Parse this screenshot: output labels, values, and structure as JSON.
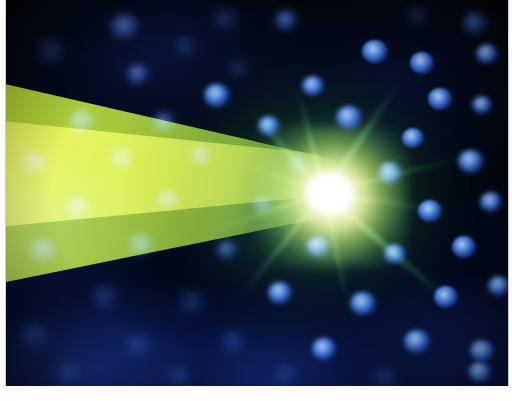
{
  "image": {
    "kind": "fluorescence-micrograph",
    "subject": "neuron with radiating neurites and DAPI-stained nuclei",
    "frame": {
      "border_color": "#ffffff",
      "border_left_px": 6,
      "border_right_px": 4,
      "border_bottom_px": 15,
      "content_width_px": 502,
      "content_height_px": 386
    },
    "background": {
      "base_color": "#000409",
      "haze_color": "#1c3696",
      "description": "dark field with deep blue out-of-focus haze"
    },
    "channels": [
      {
        "name": "green-channel",
        "label": "GFP / green fluorescence",
        "color": "#7ed321",
        "structure": "cell body and neurites"
      },
      {
        "name": "blue-channel",
        "label": "DAPI nuclear stain",
        "color": "#2d5ce0",
        "structure": "nuclei"
      },
      {
        "name": "saturated-core",
        "label": "saturated soma",
        "color": "#ffffff",
        "structure": "bright cell body"
      }
    ],
    "features": {
      "soma": {
        "name": "cell-body",
        "center_x": 324,
        "center_y": 193,
        "core_color": "#ffffff",
        "glow_color": "#e8fa96"
      },
      "light_cone": {
        "name": "light-cone",
        "description": "broad yellow-green wedge widening toward the left edge",
        "color_bright": "#c4e22c",
        "color_mid": "#b0d628",
        "color_edge": "#60a43c"
      },
      "neurites": [
        {
          "name": "neurite-up-left",
          "angle_deg": -131,
          "length": 120,
          "thickness": 5.0,
          "opacity": 0.8
        },
        {
          "name": "neurite-up",
          "angle_deg": -104,
          "length": 112,
          "thickness": 4.2,
          "opacity": 0.78
        },
        {
          "name": "neurite-up-right",
          "angle_deg": -56,
          "length": 138,
          "thickness": 4.6,
          "opacity": 0.88
        },
        {
          "name": "neurite-right",
          "angle_deg": -14,
          "length": 150,
          "thickness": 3.4,
          "opacity": 0.7
        },
        {
          "name": "neurite-right-low",
          "angle_deg": 8,
          "length": 128,
          "thickness": 3.0,
          "opacity": 0.6
        },
        {
          "name": "neurite-down-right",
          "angle_deg": 41,
          "length": 175,
          "thickness": 5.2,
          "opacity": 0.92
        },
        {
          "name": "neurite-down",
          "angle_deg": 78,
          "length": 120,
          "thickness": 4.0,
          "opacity": 0.68
        },
        {
          "name": "neurite-down-left",
          "angle_deg": 129,
          "length": 140,
          "thickness": 4.4,
          "opacity": 0.74
        },
        {
          "name": "neurite-left-low",
          "angle_deg": 161,
          "length": 130,
          "thickness": 3.6,
          "opacity": 0.55
        },
        {
          "name": "neurite-left-up",
          "angle_deg": 199,
          "length": 118,
          "thickness": 3.2,
          "opacity": 0.5
        }
      ],
      "nuclei": [
        {
          "name": "nucleus",
          "x": 104,
          "y": 14,
          "w": 30,
          "h": 26,
          "style": "soft"
        },
        {
          "name": "nucleus",
          "x": 206,
          "y": 8,
          "w": 26,
          "h": 22,
          "style": "faint"
        },
        {
          "name": "nucleus",
          "x": 268,
          "y": 10,
          "w": 24,
          "h": 21,
          "style": "soft"
        },
        {
          "name": "nucleus",
          "x": 400,
          "y": 6,
          "w": 22,
          "h": 20,
          "style": "faint"
        },
        {
          "name": "nucleus",
          "x": 456,
          "y": 12,
          "w": 26,
          "h": 23,
          "style": "soft"
        },
        {
          "name": "nucleus",
          "x": 30,
          "y": 38,
          "w": 30,
          "h": 26,
          "style": "faint"
        },
        {
          "name": "nucleus",
          "x": 168,
          "y": 36,
          "w": 22,
          "h": 20,
          "style": "faint"
        },
        {
          "name": "nucleus",
          "x": 356,
          "y": 40,
          "w": 26,
          "h": 23,
          "style": "crisp"
        },
        {
          "name": "nucleus",
          "x": 120,
          "y": 64,
          "w": 24,
          "h": 21,
          "style": "soft"
        },
        {
          "name": "nucleus",
          "x": 222,
          "y": 60,
          "w": 20,
          "h": 18,
          "style": "faint"
        },
        {
          "name": "nucleus",
          "x": 404,
          "y": 52,
          "w": 24,
          "h": 22,
          "style": "crisp"
        },
        {
          "name": "nucleus",
          "x": 470,
          "y": 44,
          "w": 22,
          "h": 20,
          "style": "mid"
        },
        {
          "name": "nucleus",
          "x": 198,
          "y": 84,
          "w": 26,
          "h": 23,
          "style": "mid"
        },
        {
          "name": "nucleus",
          "x": 296,
          "y": 76,
          "w": 22,
          "h": 20,
          "style": "mid"
        },
        {
          "name": "nucleus",
          "x": 422,
          "y": 88,
          "w": 24,
          "h": 22,
          "style": "crisp"
        },
        {
          "name": "nucleus",
          "x": 466,
          "y": 96,
          "w": 20,
          "h": 18,
          "style": "mid"
        },
        {
          "name": "nucleus",
          "x": 62,
          "y": 110,
          "w": 28,
          "h": 24,
          "style": "soft"
        },
        {
          "name": "nucleus",
          "x": 146,
          "y": 112,
          "w": 24,
          "h": 21,
          "style": "soft"
        },
        {
          "name": "nucleus",
          "x": 252,
          "y": 116,
          "w": 22,
          "h": 20,
          "style": "mid"
        },
        {
          "name": "nucleus",
          "x": 330,
          "y": 106,
          "w": 26,
          "h": 23,
          "style": "mid"
        },
        {
          "name": "nucleus",
          "x": 396,
          "y": 128,
          "w": 22,
          "h": 20,
          "style": "crisp"
        },
        {
          "name": "nucleus",
          "x": 16,
          "y": 152,
          "w": 26,
          "h": 22,
          "style": "soft"
        },
        {
          "name": "nucleus",
          "x": 104,
          "y": 148,
          "w": 24,
          "h": 22,
          "style": "soft"
        },
        {
          "name": "nucleus",
          "x": 184,
          "y": 146,
          "w": 22,
          "h": 20,
          "style": "soft"
        },
        {
          "name": "nucleus",
          "x": 282,
          "y": 156,
          "w": 20,
          "h": 18,
          "style": "soft"
        },
        {
          "name": "nucleus",
          "x": 372,
          "y": 162,
          "w": 24,
          "h": 22,
          "style": "mid"
        },
        {
          "name": "nucleus",
          "x": 452,
          "y": 150,
          "w": 26,
          "h": 23,
          "style": "mid"
        },
        {
          "name": "nucleus",
          "x": 58,
          "y": 196,
          "w": 28,
          "h": 24,
          "style": "soft"
        },
        {
          "name": "nucleus",
          "x": 150,
          "y": 190,
          "w": 24,
          "h": 21,
          "style": "soft"
        },
        {
          "name": "nucleus",
          "x": 246,
          "y": 196,
          "w": 20,
          "h": 18,
          "style": "soft"
        },
        {
          "name": "nucleus",
          "x": 412,
          "y": 200,
          "w": 24,
          "h": 22,
          "style": "crisp"
        },
        {
          "name": "nucleus",
          "x": 474,
          "y": 192,
          "w": 22,
          "h": 20,
          "style": "mid"
        },
        {
          "name": "nucleus",
          "x": 22,
          "y": 238,
          "w": 30,
          "h": 26,
          "style": "soft"
        },
        {
          "name": "nucleus",
          "x": 122,
          "y": 234,
          "w": 26,
          "h": 22,
          "style": "soft"
        },
        {
          "name": "nucleus",
          "x": 210,
          "y": 240,
          "w": 22,
          "h": 20,
          "style": "soft"
        },
        {
          "name": "nucleus",
          "x": 300,
          "y": 236,
          "w": 24,
          "h": 21,
          "style": "mid"
        },
        {
          "name": "nucleus",
          "x": 378,
          "y": 244,
          "w": 22,
          "h": 20,
          "style": "mid"
        },
        {
          "name": "nucleus",
          "x": 446,
          "y": 236,
          "w": 24,
          "h": 22,
          "style": "crisp"
        },
        {
          "name": "nucleus",
          "x": 84,
          "y": 284,
          "w": 30,
          "h": 26,
          "style": "faint"
        },
        {
          "name": "nucleus",
          "x": 172,
          "y": 290,
          "w": 28,
          "h": 24,
          "style": "faint"
        },
        {
          "name": "nucleus",
          "x": 262,
          "y": 282,
          "w": 24,
          "h": 22,
          "style": "mid"
        },
        {
          "name": "nucleus",
          "x": 344,
          "y": 292,
          "w": 26,
          "h": 23,
          "style": "mid"
        },
        {
          "name": "nucleus",
          "x": 428,
          "y": 286,
          "w": 24,
          "h": 22,
          "style": "crisp"
        },
        {
          "name": "nucleus",
          "x": 482,
          "y": 276,
          "w": 22,
          "h": 20,
          "style": "mid"
        },
        {
          "name": "nucleus",
          "x": 12,
          "y": 322,
          "w": 32,
          "h": 28,
          "style": "faint"
        },
        {
          "name": "nucleus",
          "x": 118,
          "y": 334,
          "w": 28,
          "h": 24,
          "style": "faint"
        },
        {
          "name": "nucleus",
          "x": 214,
          "y": 330,
          "w": 26,
          "h": 23,
          "style": "faint"
        },
        {
          "name": "nucleus",
          "x": 306,
          "y": 338,
          "w": 24,
          "h": 22,
          "style": "mid"
        },
        {
          "name": "nucleus",
          "x": 398,
          "y": 330,
          "w": 26,
          "h": 23,
          "style": "mid"
        },
        {
          "name": "nucleus",
          "x": 464,
          "y": 340,
          "w": 24,
          "h": 22,
          "style": "mid"
        },
        {
          "name": "nucleus",
          "x": 48,
          "y": 362,
          "w": 30,
          "h": 24,
          "style": "faint"
        },
        {
          "name": "nucleus",
          "x": 160,
          "y": 366,
          "w": 26,
          "h": 20,
          "style": "faint"
        },
        {
          "name": "nucleus",
          "x": 268,
          "y": 364,
          "w": 24,
          "h": 20,
          "style": "faint"
        },
        {
          "name": "nucleus",
          "x": 366,
          "y": 368,
          "w": 26,
          "h": 20,
          "style": "faint"
        },
        {
          "name": "nucleus",
          "x": 462,
          "y": 362,
          "w": 24,
          "h": 20,
          "style": "mid"
        }
      ]
    }
  }
}
